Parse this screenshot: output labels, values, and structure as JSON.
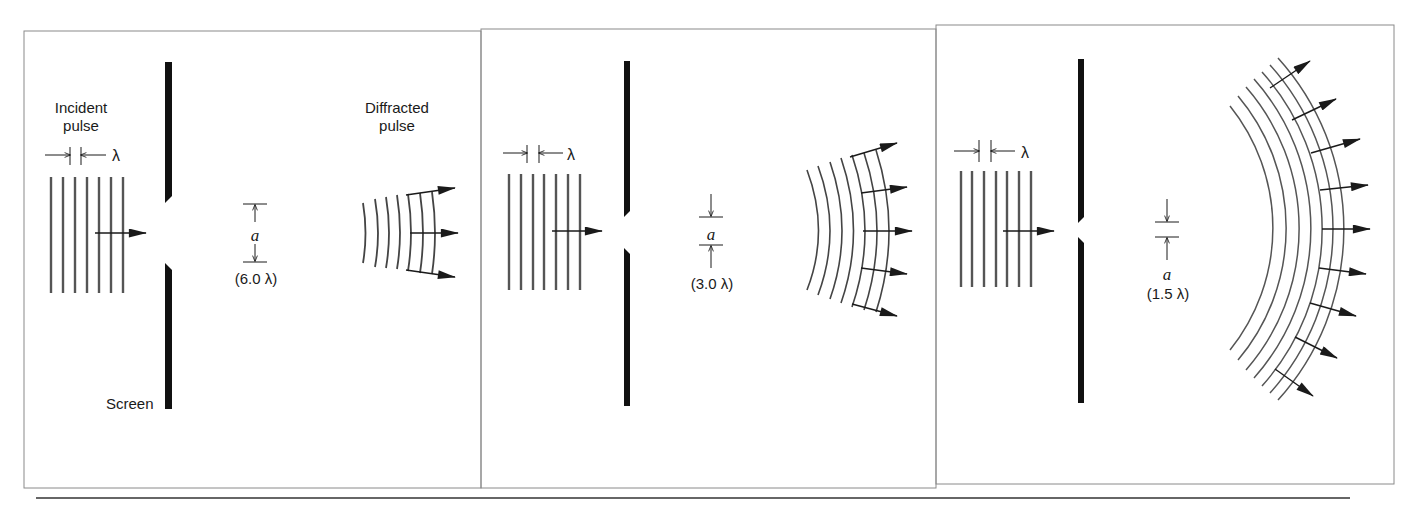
{
  "figure": {
    "colors": {
      "ink": "#1a1a1a",
      "wave": "#444444",
      "frame": "#888888",
      "background": "#ffffff"
    }
  },
  "panels": [
    {
      "id": "panel-1",
      "labels": {
        "incident": "Incident",
        "incident_line2": "pulse",
        "diffracted": "Diffracted",
        "diffracted_line2": "pulse",
        "screen": "Screen",
        "lambda": "λ",
        "slit_symbol": "a",
        "slit_width": "(6.0 λ)"
      },
      "slit_width_in_wavelengths": 6.0,
      "incident_wavefronts": 7,
      "diffracted_wavefronts": 7,
      "diffracted_arrows": 3
    },
    {
      "id": "panel-2",
      "labels": {
        "lambda": "λ",
        "slit_symbol": "a",
        "slit_width": "(3.0 λ)"
      },
      "slit_width_in_wavelengths": 3.0,
      "incident_wavefronts": 7,
      "diffracted_wavefronts": 7,
      "diffracted_arrows": 5
    },
    {
      "id": "panel-3",
      "labels": {
        "lambda": "λ",
        "slit_symbol": "a",
        "slit_width": "(1.5 λ)"
      },
      "slit_width_in_wavelengths": 1.5,
      "incident_wavefronts": 7,
      "diffracted_wavefronts": 7,
      "diffracted_arrows": 9
    }
  ]
}
